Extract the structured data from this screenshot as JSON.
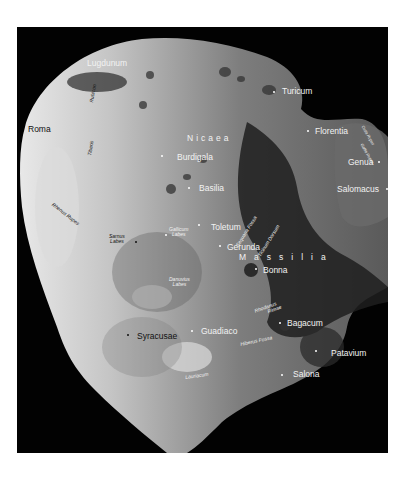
{
  "map": {
    "subject": "Asteroid surface map",
    "regions": [
      {
        "name": "Nicaea",
        "x": 170,
        "y": 107
      },
      {
        "name": "Massilia",
        "x": 222,
        "y": 226
      }
    ],
    "places": [
      {
        "name": "Lugdunum",
        "x": 70,
        "y": 32,
        "color": "light",
        "dot": false
      },
      {
        "name": "Turicum",
        "x": 265,
        "y": 60,
        "color": "light",
        "dot": true,
        "dx": 256,
        "dy": 64
      },
      {
        "name": "Roma",
        "x": 11,
        "y": 98,
        "color": "dark",
        "dot": false
      },
      {
        "name": "Florentia",
        "x": 298,
        "y": 100,
        "color": "light",
        "dot": true,
        "dx": 290,
        "dy": 103
      },
      {
        "name": "Burdigala",
        "x": 160,
        "y": 126,
        "color": "light",
        "dot": true,
        "dx": 144,
        "dy": 128
      },
      {
        "name": "Genua",
        "x": 331,
        "y": 131,
        "color": "light",
        "dot": true,
        "dx": 361,
        "dy": 134
      },
      {
        "name": "Basilia",
        "x": 182,
        "y": 157,
        "color": "light",
        "dot": true,
        "dx": 171,
        "dy": 160
      },
      {
        "name": "Salomacus",
        "x": 320,
        "y": 158,
        "color": "light",
        "dot": true,
        "dx": 369,
        "dy": 161
      },
      {
        "name": "Toletum",
        "x": 194,
        "y": 196,
        "color": "light",
        "dot": true,
        "dx": 181,
        "dy": 197
      },
      {
        "name": "Gerunda",
        "x": 210,
        "y": 216,
        "color": "light",
        "dot": true,
        "dx": 202,
        "dy": 218
      },
      {
        "name": "Bonna",
        "x": 246,
        "y": 239,
        "color": "light",
        "dot": true,
        "dx": 238,
        "dy": 241
      },
      {
        "name": "Syracusae",
        "x": 120,
        "y": 305,
        "color": "dark",
        "dot": true,
        "dx": 110,
        "dy": 307
      },
      {
        "name": "Guadiaco",
        "x": 184,
        "y": 300,
        "color": "light",
        "dot": true,
        "dx": 174,
        "dy": 303
      },
      {
        "name": "Bagacum",
        "x": 270,
        "y": 292,
        "color": "light",
        "dot": true,
        "dx": 262,
        "dy": 295
      },
      {
        "name": "Patavium",
        "x": 314,
        "y": 322,
        "color": "light",
        "dot": true,
        "dx": 298,
        "dy": 323
      },
      {
        "name": "Salona",
        "x": 276,
        "y": 343,
        "color": "light",
        "dot": true,
        "dx": 264,
        "dy": 347
      }
    ],
    "features": [
      {
        "name": "Rhenus Rupes",
        "x": 37,
        "y": 175,
        "rot": 38,
        "color": "dark"
      },
      {
        "name": "Tiberis",
        "x": 70,
        "y": 128,
        "rot": -80,
        "color": "dark"
      },
      {
        "name": "Rubicon",
        "x": 72,
        "y": 75,
        "rot": -80,
        "color": "dark"
      },
      {
        "name": "Sarnus Labes",
        "x": 92,
        "y": 207,
        "rot": 0,
        "color": "dark",
        "lines": [
          "Sarnus",
          "Labes"
        ]
      },
      {
        "name": "Gallicum Labes",
        "x": 152,
        "y": 200,
        "rot": 0,
        "color": "light",
        "lines": [
          "Gallicum",
          "Labes"
        ]
      },
      {
        "name": "Danuvius Labes",
        "x": 152,
        "y": 250,
        "rot": 0,
        "color": "light",
        "lines": [
          "Danuvius",
          "Labes"
        ]
      },
      {
        "name": "Sequana Fossa",
        "x": 218,
        "y": 180,
        "rot": -58,
        "color": "light"
      },
      {
        "name": "Ticinum Dorsum",
        "x": 248,
        "y": 190,
        "rot": -58,
        "color": "light"
      },
      {
        "name": "Rhodanus Rimae",
        "x": 237,
        "y": 282,
        "rot": -20,
        "color": "light",
        "lines": [
          "Rhodanus",
          "Rimae"
        ]
      },
      {
        "name": "Hiberus Fossa",
        "x": 223,
        "y": 311,
        "rot": -12,
        "color": "light"
      },
      {
        "name": "Lauriacum",
        "x": 168,
        "y": 345,
        "rot": -8,
        "color": "light"
      },
      {
        "name": "Ostia Rupes",
        "x": 341,
        "y": 100,
        "rot": 60,
        "color": "light"
      },
      {
        "name": "Gallia Rupes",
        "x": 338,
        "y": 118,
        "rot": 60,
        "color": "light"
      }
    ]
  }
}
